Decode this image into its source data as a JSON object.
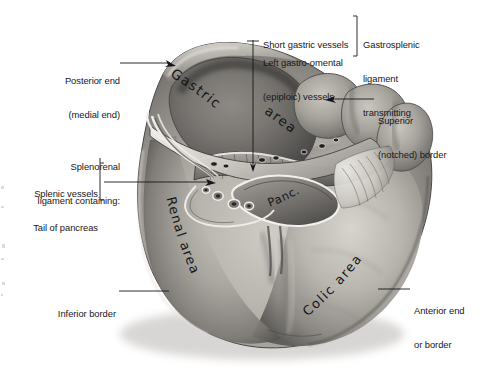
{
  "figure": {
    "organ_name": "spleen",
    "background_color": "#ffffff",
    "ink_color": "#16171a"
  },
  "callouts": {
    "posterior_end": {
      "line1": "Posterior end",
      "line2": "(medial end)"
    },
    "short_gastric": {
      "line1": "Short gastric vessels"
    },
    "left_gastro_omental": {
      "line1": "Left gastro-omental",
      "line2": "(epiploic) vessels"
    },
    "gastrosplenic": {
      "line1": "Gastrosplenic",
      "line2": "ligament",
      "line3": "transmitting"
    },
    "superior_border": {
      "line1": "Superior",
      "line2": "(notched) border"
    },
    "splenorenal": {
      "line1": "Splenorenal",
      "line2": "ligament containing:"
    },
    "splenic_vessels": {
      "line1": "Splenic vessels"
    },
    "tail_of_pancreas": {
      "line1": "Tail of pancreas"
    },
    "inferior_border": {
      "line1": "Inferior border"
    },
    "anterior_end": {
      "line1": "Anterior end",
      "line2": "or border"
    }
  },
  "surface_labels": {
    "gastric": "Gastric",
    "gastric_area": "area",
    "renal_area": "Renal area",
    "colic_area": "Colic area",
    "pancreas_abbrev": "Panc."
  },
  "colors": {
    "organ_light": "#d6d3ce",
    "organ_mid": "#9a9792",
    "organ_dark": "#5c5a57",
    "organ_shadow": "#3a3836",
    "hilum_dark": "#2e2c2b",
    "ligament_white": "#f2f0ec",
    "leader_line": "#16171a"
  }
}
